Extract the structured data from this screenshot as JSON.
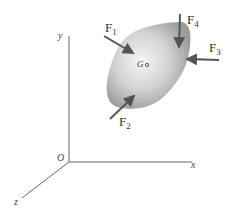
{
  "diagram": {
    "type": "free-body diagram of rigid body in 3D",
    "axes": {
      "x_label": "x",
      "y_label": "y",
      "z_label": "z",
      "origin_label": "O"
    },
    "body": {
      "center_label": "G"
    },
    "forces": [
      {
        "base": "F",
        "sub": "1"
      },
      {
        "base": "F",
        "sub": "2"
      },
      {
        "base": "F",
        "sub": "3"
      },
      {
        "base": "F",
        "sub": "4"
      }
    ],
    "colors": {
      "axis": "#555555",
      "arrow": "#555555",
      "body_light": "#f4f4f4",
      "body_dark": "#9a9a9a"
    }
  }
}
